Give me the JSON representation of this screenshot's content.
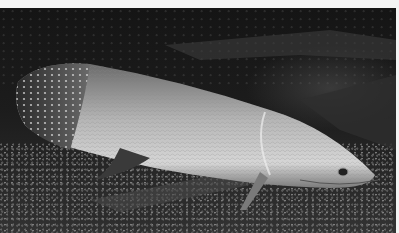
{
  "image": {
    "subject": "arapaima fish resting on gravel",
    "palette": {
      "background_dark": "#151515",
      "gravel_light": "#999999",
      "fish_body": "#b8b8b8",
      "fish_belly": "#d8d8d8",
      "border": "#f4f4f4"
    }
  }
}
